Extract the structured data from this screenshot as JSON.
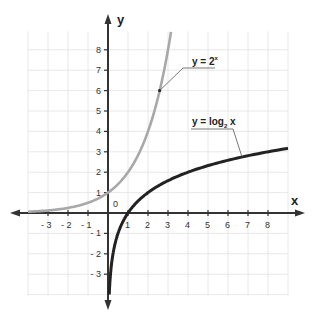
{
  "chart_data": {
    "type": "line",
    "title": "",
    "xlabel": "x",
    "ylabel": "y",
    "xlim": [
      -4,
      9
    ],
    "ylim": [
      -4,
      9
    ],
    "grid": true,
    "x_ticks": [
      -3,
      -2,
      -1,
      1,
      2,
      3,
      4,
      5,
      6,
      7,
      8
    ],
    "y_ticks": [
      -3,
      -2,
      -1,
      1,
      2,
      3,
      4,
      5,
      6,
      7,
      8
    ],
    "x_tick_labels": [
      "- 3",
      "- 2",
      "- 1",
      "1",
      "2",
      "3",
      "4",
      "5",
      "6",
      "7",
      "8"
    ],
    "y_tick_labels": [
      "- 3",
      "- 2",
      "- 1",
      "1",
      "2",
      "3",
      "4",
      "5",
      "6",
      "7",
      "8"
    ],
    "origin_label": "0",
    "series": [
      {
        "name": "y = 2^x",
        "label_text": "y = 2",
        "label_sup": "x",
        "color": "#a8a8a8",
        "function": "2^x",
        "x": [
          -4,
          -3,
          -2,
          -1,
          0,
          1,
          2,
          2.5,
          3,
          3.17
        ],
        "y": [
          0.0625,
          0.125,
          0.25,
          0.5,
          1,
          2,
          4,
          5.66,
          8,
          9.0
        ],
        "callout_point": [
          2.58,
          6.0
        ]
      },
      {
        "name": "y = log2 x",
        "label_text": "y = log",
        "label_sub": "2",
        "label_tail": " x",
        "color": "#222222",
        "function": "log2(x)",
        "x": [
          0.0625,
          0.125,
          0.25,
          0.5,
          1,
          2,
          3,
          4,
          5,
          6,
          7,
          8,
          9
        ],
        "y": [
          -4,
          -3,
          -2,
          -1,
          0,
          1,
          1.585,
          2,
          2.32,
          2.585,
          2.81,
          3,
          3.17
        ],
        "callout_point": [
          6.7,
          2.75
        ]
      }
    ]
  }
}
